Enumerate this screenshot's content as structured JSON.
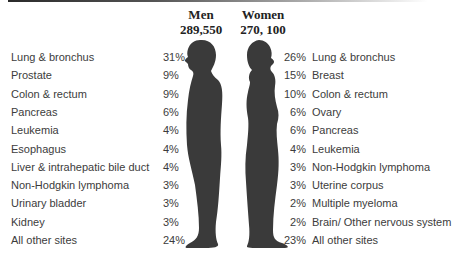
{
  "chart_data": {
    "type": "table",
    "title": "",
    "series": [
      {
        "name": "Men",
        "total": "289,550",
        "categories": [
          "Lung & bronchus",
          "Prostate",
          "Colon & rectum",
          "Pancreas",
          "Leukemia",
          "Esophagus",
          "Liver & intrahepatic bile duct",
          "Non-Hodgkin lymphoma",
          "Urinary bladder",
          "Kidney",
          "All other sites"
        ],
        "values": [
          31,
          9,
          9,
          6,
          4,
          4,
          4,
          3,
          3,
          3,
          24
        ],
        "labels": [
          "31%",
          "9%",
          "9%",
          "6%",
          "4%",
          "4%",
          "4%",
          "3%",
          "3%",
          "3%",
          "24%"
        ]
      },
      {
        "name": "Women",
        "total": "270, 100",
        "categories": [
          "Lung & bronchus",
          "Breast",
          "Colon & rectum",
          "Ovary",
          "Pancreas",
          "Leukemia",
          "Non-Hodgkin lymphoma",
          "Uterine corpus",
          "Multiple myeloma",
          "Brain/ Other nervous system",
          "All other sites"
        ],
        "values": [
          26,
          15,
          10,
          6,
          6,
          4,
          3,
          3,
          2,
          2,
          23
        ],
        "labels": [
          "26%",
          "15%",
          "10%",
          "6%",
          "6%",
          "4%",
          "3%",
          "3%",
          "2%",
          "2%",
          "23%"
        ]
      }
    ],
    "unit": "percent",
    "silhouette_color": "#3a3a3a"
  },
  "header": {
    "men_title": "Men",
    "men_total": "289,550",
    "women_title": "Women",
    "women_total": "270, 100"
  }
}
